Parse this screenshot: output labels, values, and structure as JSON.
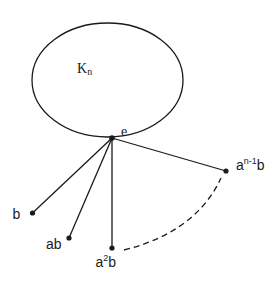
{
  "diagram": {
    "type": "graph",
    "colors": {
      "stroke": "#1a1a1a",
      "background": "#ffffff"
    },
    "cluster": {
      "label_main": "K",
      "label_sub": "n",
      "shape": "ellipse"
    },
    "hub": {
      "label": "e"
    },
    "leaves": [
      {
        "id": "b",
        "label_main": "b",
        "label_sup": "",
        "label_tail": ""
      },
      {
        "id": "ab",
        "label_main": "ab",
        "label_sup": "",
        "label_tail": ""
      },
      {
        "id": "a2b",
        "label_main": "a",
        "label_sup": "2",
        "label_tail": "b"
      },
      {
        "id": "an1b",
        "label_main": "a",
        "label_sup": "n-1",
        "label_tail": "b"
      }
    ],
    "ellipsis_arc": {
      "style": "dashed",
      "meaning": "continuation of vertices a^3b ... a^(n-2)b"
    }
  }
}
